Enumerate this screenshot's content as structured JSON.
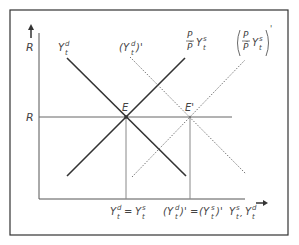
{
  "diagram": {
    "y_axis_label": "R",
    "x_axis_label": "Y",
    "x_axis_label_sup1": "s",
    "x_axis_label_sup2": "d",
    "x_axis_label_sub": "t",
    "r_level_label": "R",
    "equilibrium_label": "E",
    "new_equilibrium_label": "E'",
    "curves": {
      "demand": {
        "base": "Y",
        "sup": "d",
        "sub": "t"
      },
      "supply": {
        "frac_num": "P",
        "frac_den": "P̄",
        "base": "Y",
        "sup": "s",
        "sub": "t"
      },
      "demand_shifted": {
        "base": "(Y",
        "sup": "d",
        "sub": "t",
        "tail": ")'"
      },
      "supply_shifted": {
        "frac_num": "P",
        "frac_den": "P̄",
        "base": "Y",
        "sup": "s",
        "sub": "t"
      }
    },
    "x_tick_1": {
      "lhs": "Y",
      "lhs_sup": "d",
      "lhs_sub": "t",
      "eq": "=",
      "rhs": "Y",
      "rhs_sup": "s",
      "rhs_sub": "t"
    },
    "x_tick_2": {
      "lhs": "(Y",
      "lhs_sup": "d",
      "lhs_sub": "t",
      "lhs_tail": ")'",
      "eq": "=",
      "rhs": "(Y",
      "rhs_sup": "s",
      "rhs_sub": "t",
      "rhs_tail": ")'"
    },
    "colors": {
      "frame": "#333333",
      "axis": "#555555",
      "solid_curve": "#333333",
      "dotted_curve": "#777777",
      "guide": "#888888"
    }
  }
}
